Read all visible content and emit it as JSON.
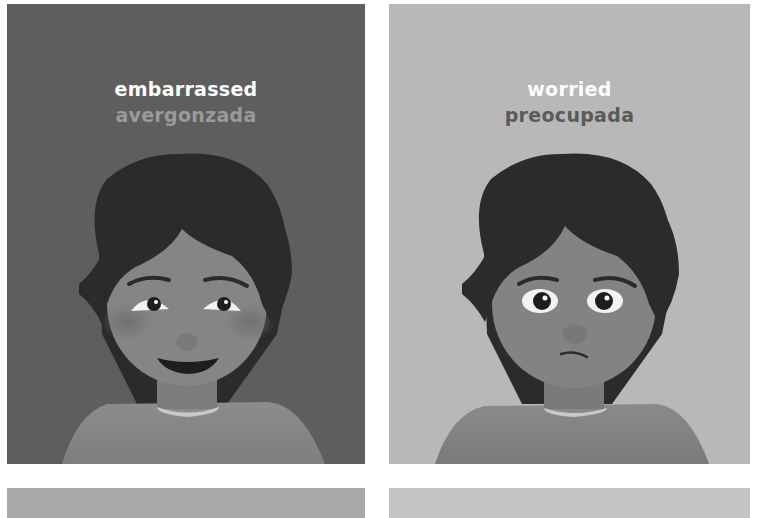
{
  "cards": [
    {
      "english": "embarrassed",
      "spanish": "avergonzada",
      "background": "#5e5e5e",
      "spanish_color": "#9a9a9a",
      "expression": "smiling-blushing"
    },
    {
      "english": "worried",
      "spanish": "preocupada",
      "background": "#b8b8b8",
      "spanish_color": "#5a5a5a",
      "expression": "frowning"
    },
    {
      "background": "#a8a8a8"
    },
    {
      "background": "#c4c4c4"
    }
  ]
}
